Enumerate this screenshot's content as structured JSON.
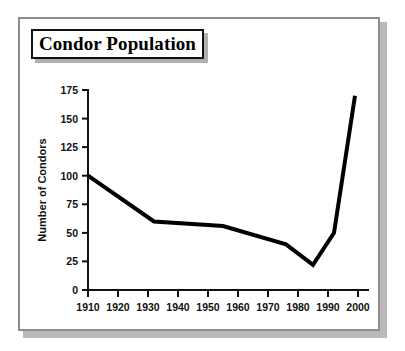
{
  "frame": {
    "border_color": "#8d8d8d",
    "shadow_color": "#b9b9b9",
    "background": "#ffffff"
  },
  "title": {
    "text": "Condor Population",
    "border_color": "#111111"
  },
  "chart_data": {
    "type": "line",
    "title": "Condor Population",
    "xlabel": "",
    "ylabel": "Number of Condors",
    "xlim": [
      1910,
      2000
    ],
    "ylim": [
      0,
      175
    ],
    "grid": false,
    "legend": "none",
    "line_color": "#000000",
    "x_ticks": [
      "1910",
      "1920",
      "1930",
      "1940",
      "1950",
      "1960",
      "1970",
      "1980",
      "1990",
      "2000"
    ],
    "y_ticks": [
      "0",
      "25",
      "50",
      "75",
      "100",
      "125",
      "150",
      "175"
    ],
    "x": [
      1910,
      1932,
      1955,
      1976,
      1985,
      1992,
      1999
    ],
    "values": [
      100,
      60,
      56,
      40,
      22,
      50,
      170
    ],
    "series": [
      {
        "name": "Number of Condors",
        "points": [
          {
            "year": 1910,
            "count": 100
          },
          {
            "year": 1932,
            "count": 60
          },
          {
            "year": 1955,
            "count": 56
          },
          {
            "year": 1976,
            "count": 40
          },
          {
            "year": 1985,
            "count": 22
          },
          {
            "year": 1992,
            "count": 50
          },
          {
            "year": 1999,
            "count": 170
          }
        ]
      }
    ]
  }
}
